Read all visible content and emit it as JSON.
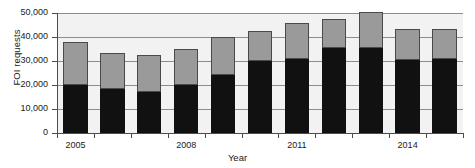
{
  "chart_data": {
    "type": "bar",
    "stacked": true,
    "title": "",
    "xlabel": "Year",
    "ylabel": "FOI requests",
    "categories": [
      "2005",
      "2006",
      "2007",
      "2008",
      "2009",
      "2010",
      "2011",
      "2012",
      "2013",
      "2014",
      "2015"
    ],
    "xtick_labels": [
      "2005",
      "2008",
      "2011",
      "2014"
    ],
    "xtick_label_indices": [
      0,
      3,
      6,
      9
    ],
    "ylim": [
      0,
      50000
    ],
    "yticks": [
      0,
      10000,
      20000,
      30000,
      40000,
      50000
    ],
    "ytick_labels": [
      "0",
      "10,000",
      "20,000",
      "30,000",
      "40,000",
      "50,000"
    ],
    "grid": true,
    "legend": "none",
    "series": [
      {
        "name": "lower",
        "color": "#111111",
        "values": [
          20000,
          18500,
          17000,
          20000,
          24000,
          30000,
          31000,
          35500,
          35500,
          30500,
          31000
        ]
      },
      {
        "name": "upper",
        "color": "#9a9a9a",
        "values": [
          18000,
          15000,
          15500,
          15000,
          16000,
          12500,
          15000,
          12000,
          15000,
          13000,
          12500
        ]
      }
    ],
    "totals": [
      38000,
      33500,
      32500,
      35000,
      40000,
      42500,
      46000,
      47500,
      50500,
      43500,
      43500
    ]
  },
  "colors": {
    "lower_series": "#111111",
    "upper_series": "#9a9a9a",
    "plot_background": "#f2f2f2",
    "gridline": "#8d8d8d",
    "axis": "#4d4d4d",
    "text": "#1a1a1a"
  }
}
